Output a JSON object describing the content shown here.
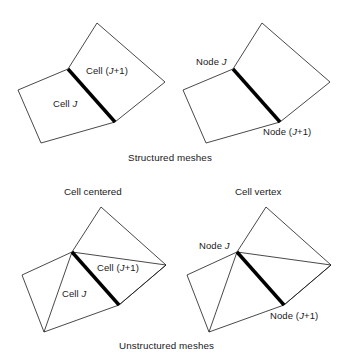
{
  "figure": {
    "name": "mesh-types-diagram",
    "background_color": "#ffffff",
    "line_color": "#1a1a1a",
    "bold_edge_color": "#000000",
    "captions": {
      "structured": "Structured meshes",
      "unstructured": "Unstructured meshes"
    },
    "panel_titles": {
      "cell_centered": "Cell centered",
      "cell_vertex": "Cell vertex"
    }
  },
  "panels": [
    {
      "id": "structured-cell-centered",
      "row": "structured",
      "scheme": "cell-centered",
      "labels": [
        {
          "name": "cell-j-label",
          "html": "Cell <em>J</em>",
          "text": "Cell J"
        },
        {
          "name": "cell-jp1-label",
          "html": "Cell (<em>J</em>+1)",
          "text": "Cell (J+1)"
        }
      ]
    },
    {
      "id": "structured-cell-vertex",
      "row": "structured",
      "scheme": "cell-vertex",
      "labels": [
        {
          "name": "node-j-label",
          "html": "Node <em>J</em>",
          "text": "Node J"
        },
        {
          "name": "node-jp1-label",
          "html": "Node (<em>J</em>+1)",
          "text": "Node (J+1)"
        }
      ]
    },
    {
      "id": "unstructured-cell-centered",
      "row": "unstructured",
      "scheme": "cell-centered",
      "labels": [
        {
          "name": "cell-j-label",
          "html": "Cell <em>J</em>",
          "text": "Cell J"
        },
        {
          "name": "cell-jp1-label",
          "html": "Cell (<em>J</em>+1)",
          "text": "Cell (J+1)"
        }
      ]
    },
    {
      "id": "unstructured-cell-vertex",
      "row": "unstructured",
      "scheme": "cell-vertex",
      "labels": [
        {
          "name": "node-j-label",
          "html": "Node <em>J</em>",
          "text": "Node J"
        },
        {
          "name": "node-jp1-label",
          "html": "Node (<em>J</em>+1)",
          "text": "Node (J+1)"
        }
      ]
    }
  ],
  "labels": {
    "tl_cell_j": "Cell J",
    "tl_cell_j_prefix": "Cell ",
    "tl_cell_j_italic": "J",
    "tl_cell_jp1_prefix": "Cell (",
    "tl_cell_jp1_italic": "J",
    "tl_cell_jp1_suffix": "+1)",
    "tr_node_j_prefix": "Node ",
    "tr_node_j_italic": "J",
    "tr_node_jp1_prefix": "Node (",
    "tr_node_jp1_italic": "J",
    "tr_node_jp1_suffix": "+1)",
    "bl_cell_j_prefix": "Cell ",
    "bl_cell_j_italic": "J",
    "bl_cell_jp1_prefix": "Cell (",
    "bl_cell_jp1_italic": "J",
    "bl_cell_jp1_suffix": "+1)",
    "br_node_j_prefix": "Node ",
    "br_node_j_italic": "J",
    "br_node_jp1_prefix": "Node (",
    "br_node_jp1_italic": "J",
    "br_node_jp1_suffix": "+1)",
    "panel_cell_centered": "Cell centered",
    "panel_cell_vertex": "Cell vertex",
    "caption_structured": "Structured meshes",
    "caption_unstructured": "Unstructured meshes"
  },
  "geometry": {
    "note": "Polygon vertex coordinates in screenshot pixel space",
    "structured_left": {
      "quad_j": [
        [
          18,
          90
        ],
        [
          68,
          69
        ],
        [
          115,
          122
        ],
        [
          41,
          143
        ]
      ],
      "quad_jp1": [
        [
          68,
          69
        ],
        [
          97,
          23
        ],
        [
          165,
          82
        ],
        [
          115,
          122
        ]
      ],
      "shared_edge": [
        [
          68,
          69
        ],
        [
          115,
          122
        ]
      ]
    },
    "structured_right": {
      "quad_j": [
        [
          183,
          90
        ],
        [
          233,
          69
        ],
        [
          280,
          122
        ],
        [
          206,
          143
        ]
      ],
      "quad_jp1": [
        [
          233,
          69
        ],
        [
          262,
          23
        ],
        [
          330,
          82
        ],
        [
          280,
          122
        ]
      ],
      "shared_edge": [
        [
          233,
          69
        ],
        [
          280,
          122
        ]
      ]
    },
    "unstructured_left": {
      "outer": [
        [
          22,
          275
        ],
        [
          72,
          252
        ],
        [
          101,
          207
        ],
        [
          166,
          265
        ],
        [
          119,
          305
        ],
        [
          44,
          332
        ]
      ],
      "shared_edge": [
        [
          72,
          252
        ],
        [
          119,
          305
        ]
      ],
      "extra_edges": [
        [
          [
            72,
            252
          ],
          [
            44,
            332
          ]
        ],
        [
          [
            72,
            252
          ],
          [
            166,
            265
          ]
        ],
        [
          [
            119,
            305
          ],
          [
            166,
            265
          ]
        ]
      ]
    },
    "unstructured_right": {
      "outer": [
        [
          187,
          275
        ],
        [
          237,
          252
        ],
        [
          266,
          207
        ],
        [
          331,
          265
        ],
        [
          284,
          305
        ],
        [
          209,
          332
        ]
      ],
      "shared_edge": [
        [
          237,
          252
        ],
        [
          284,
          305
        ]
      ],
      "extra_edges": [
        [
          [
            237,
            252
          ],
          [
            209,
            332
          ]
        ],
        [
          [
            237,
            252
          ],
          [
            331,
            265
          ]
        ],
        [
          [
            284,
            305
          ],
          [
            331,
            265
          ]
        ]
      ]
    }
  }
}
